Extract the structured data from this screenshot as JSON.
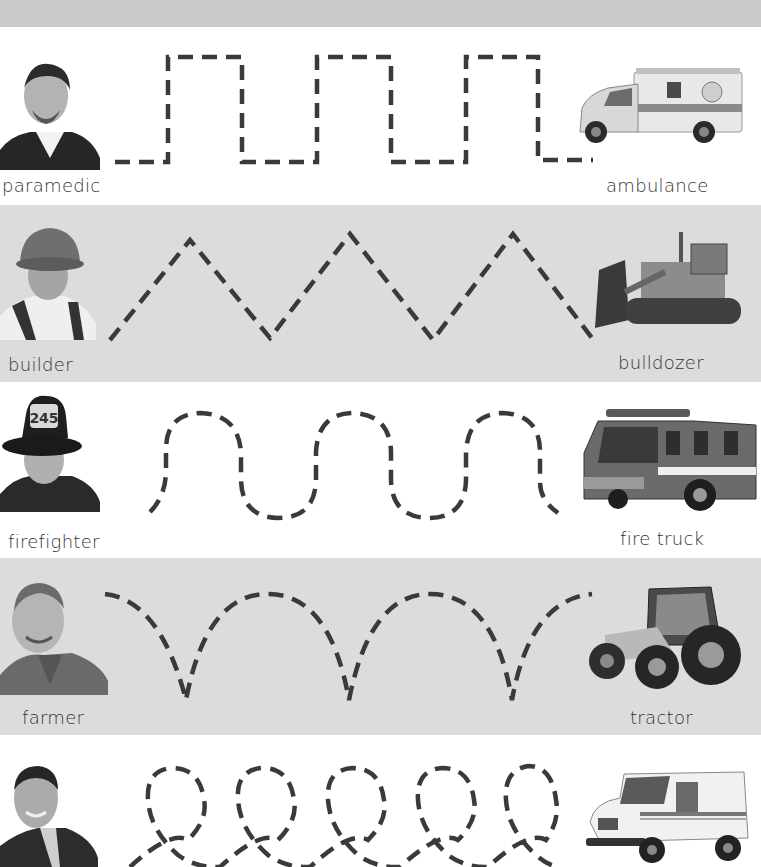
{
  "worksheet": {
    "type": "tracing-worksheet",
    "rows": [
      {
        "person": "paramedic",
        "vehicle": "ambulance",
        "line_style": "square-wave"
      },
      {
        "person": "builder",
        "vehicle": "bulldozer",
        "line_style": "zigzag"
      },
      {
        "person": "firefighter",
        "vehicle": "fire truck",
        "line_style": "wave"
      },
      {
        "person": "farmer",
        "vehicle": "tractor",
        "line_style": "scallop"
      },
      {
        "person": "",
        "vehicle": "",
        "line_style": "loops"
      }
    ]
  },
  "colors": {
    "top_band": "#c9c9c9",
    "gray_band": "#dcdcdc",
    "white_band": "#ffffff",
    "trace_line": "#3a3a3a",
    "label_text": "#333333"
  },
  "images": {
    "row0_person": "paramedic-photo",
    "row0_vehicle": "ambulance-photo",
    "row1_person": "builder-photo",
    "row1_vehicle": "bulldozer-photo",
    "row2_person": "firefighter-photo",
    "row2_vehicle": "fire-truck-photo",
    "row3_person": "farmer-photo",
    "row3_vehicle": "tractor-photo",
    "row4_person": "mail-carrier-photo",
    "row4_vehicle": "mail-truck-photo"
  }
}
